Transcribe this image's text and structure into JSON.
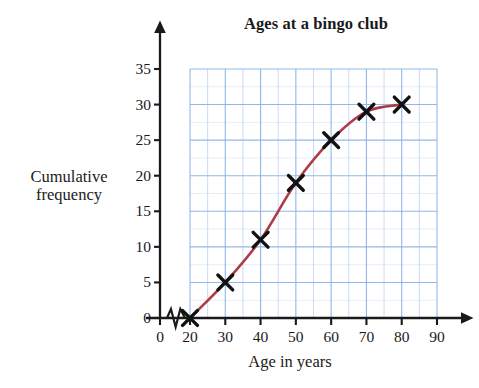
{
  "chart_data": {
    "type": "line",
    "title": "Ages at a bingo club",
    "xlabel": "Age in years",
    "ylabel": "Cumulative frequency",
    "ylabel_lines": [
      "Cumulative",
      "frequency"
    ],
    "x": [
      20,
      30,
      40,
      50,
      60,
      70,
      80
    ],
    "values": [
      0,
      5,
      11,
      19,
      25,
      29,
      30
    ],
    "series": [
      {
        "name": "Cumulative frequency",
        "x": [
          20,
          30,
          40,
          50,
          60,
          70,
          80
        ],
        "values": [
          0,
          5,
          11,
          19,
          25,
          29,
          30
        ]
      }
    ],
    "xlim": [
      0,
      95
    ],
    "ylim": [
      0,
      37
    ],
    "xticks": [
      0,
      20,
      30,
      40,
      50,
      60,
      70,
      80,
      90
    ],
    "xtick_labels": [
      "0",
      "20",
      "30",
      "40",
      "50",
      "60",
      "70",
      "80",
      "90"
    ],
    "yticks": [
      0,
      5,
      10,
      15,
      20,
      25,
      30,
      35
    ],
    "ytick_labels": [
      "0",
      "5",
      "10",
      "15",
      "20",
      "25",
      "30",
      "35"
    ],
    "grid": true,
    "grid_x_step": 5,
    "grid_y_step": 5,
    "grid_x_range": [
      20,
      90
    ],
    "grid_y_range": [
      0,
      35
    ],
    "legend": null,
    "legend_position": "none",
    "axis_break": {
      "axis": "x",
      "symbol": "zigzag",
      "between": [
        0,
        20
      ]
    },
    "marker": "x-cross",
    "colors": {
      "curve": "#b03a46",
      "marker": "#111111",
      "grid": "#8ab4e8",
      "axis": "#1a1a1a",
      "background": "#ffffff",
      "text": "#1a1a1a"
    }
  }
}
